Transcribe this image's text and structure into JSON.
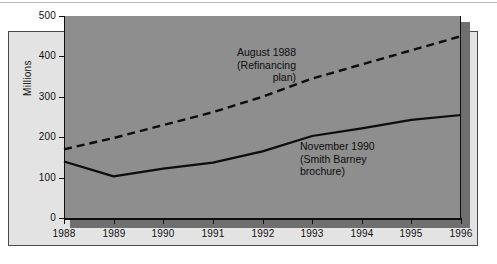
{
  "figure": {
    "background_color": "#ffffff",
    "outer_panel_color": "#e3e3e3",
    "plot_background_color": "#8e8e8e",
    "line_color": "#0d0d0d"
  },
  "chart_data": {
    "type": "line",
    "title": "",
    "subtitle": "",
    "xlabel": "",
    "ylabel": "Millions",
    "x": [
      1988,
      1989,
      1990,
      1991,
      1992,
      1993,
      1994,
      1995,
      1996
    ],
    "categories": [
      "1988",
      "1989",
      "1990",
      "1991",
      "1992",
      "1993",
      "1994",
      "1995",
      "1996"
    ],
    "xlim": [
      1988,
      1996
    ],
    "ylim": [
      0,
      500
    ],
    "yticks": [
      0,
      100,
      200,
      300,
      400,
      500
    ],
    "ytick_labels": [
      "0",
      "100",
      "200",
      "300",
      "400",
      "500"
    ],
    "grid": false,
    "legend_position": "in-plot annotations",
    "series": [
      {
        "name": "August 1988 (Refinancing plan)",
        "style": "dashed",
        "values": [
          170,
          198,
          230,
          262,
          300,
          345,
          380,
          415,
          450
        ]
      },
      {
        "name": "November 1990 (Smith Barney brochure)",
        "style": "solid",
        "values": [
          140,
          103,
          122,
          137,
          165,
          203,
          222,
          243,
          255
        ]
      }
    ],
    "annotations": [
      {
        "id": "dashed-series-label",
        "text": "August 1988\n(Refinancing\nplan)",
        "align": "right"
      },
      {
        "id": "solid-series-label",
        "text": "November 1990\n(Smith Barney\nbrochure)",
        "align": "left"
      }
    ]
  }
}
